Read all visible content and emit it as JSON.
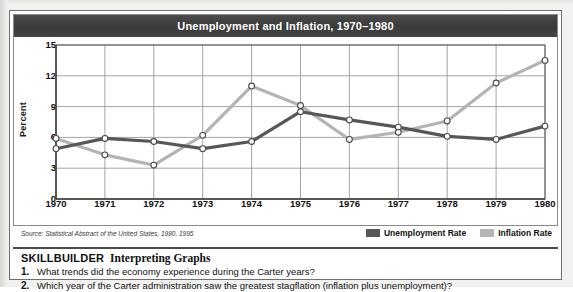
{
  "figure": {
    "title": "Unemployment and Inflation, 1970–1980",
    "source": "Source: Statistical Abstract of the United States, 1980, 1995"
  },
  "legend": {
    "items": [
      {
        "label": "Unemployment Rate",
        "color": "#575757"
      },
      {
        "label": "Inflation Rate",
        "color": "#b4b4b4"
      }
    ]
  },
  "skillbuilder": {
    "heading_main": "SKILLBUILDER",
    "heading_sub": "Interpreting Graphs",
    "questions": [
      {
        "num": "1.",
        "text": "What trends did the economy experience during the Carter years?"
      },
      {
        "num": "2.",
        "text": "Which year of the Carter administration saw the greatest stagflation (inflation plus unemployment)?"
      }
    ]
  },
  "chart_data": {
    "type": "line",
    "title": "Unemployment and Inflation, 1970–1980",
    "xlabel": "",
    "ylabel": "Percent",
    "x": [
      1970,
      1971,
      1972,
      1973,
      1974,
      1975,
      1976,
      1977,
      1978,
      1979,
      1980
    ],
    "xtick_labels": [
      "1970",
      "1971",
      "1972",
      "1973",
      "1974",
      "1975",
      "1976",
      "1977",
      "1978",
      "1979",
      "1980"
    ],
    "ytick_labels": [
      "0",
      "3",
      "6",
      "9",
      "12",
      "15"
    ],
    "yticks": [
      0,
      3,
      6,
      9,
      12,
      15
    ],
    "ylim": [
      0,
      15
    ],
    "grid": true,
    "legend_position": "below-right",
    "series": [
      {
        "name": "Unemployment Rate",
        "color": "#575757",
        "values": [
          4.9,
          5.9,
          5.6,
          4.9,
          5.6,
          8.5,
          7.7,
          7.0,
          6.1,
          5.8,
          7.1
        ]
      },
      {
        "name": "Inflation Rate",
        "color": "#b4b4b4",
        "values": [
          5.9,
          4.3,
          3.3,
          6.2,
          11.0,
          9.1,
          5.8,
          6.5,
          7.6,
          11.3,
          13.5
        ]
      }
    ]
  }
}
